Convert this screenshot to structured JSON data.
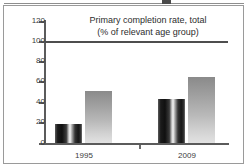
{
  "chart_data": {
    "type": "bar",
    "title": "Primary completion rate, total",
    "subtitle": "(% of relevant age group)",
    "xlabel": "",
    "ylabel": "",
    "ylim": [
      0,
      120
    ],
    "yticks": [
      0,
      20,
      40,
      60,
      80,
      100,
      120
    ],
    "ytick_labels": [
      "0",
      "20",
      "40",
      "60",
      "80",
      "100",
      "120"
    ],
    "grid": false,
    "legend": "none",
    "categories": [
      "1995",
      "2009"
    ],
    "series": [
      {
        "name": "series-1",
        "values": [
          19,
          43
        ],
        "style": "dark-gradient"
      },
      {
        "name": "series-2",
        "values": [
          51,
          64
        ],
        "style": "light-gradient"
      }
    ],
    "reference_line": {
      "value": 100,
      "label": ""
    },
    "colors": {
      "axis": "#5b5b5b",
      "reference_line": "#4e4e4e",
      "series_1_dark": "#141414",
      "series_1_highlight": "#f1f1f1",
      "series_2_top": "#8a8a8a",
      "series_2_bottom": "#e2e2e2",
      "frame_border": "#9a9a9a",
      "text": "#2d2d2d",
      "background": "#ffffff"
    }
  },
  "ticks": {
    "t120": "120",
    "t100": "100",
    "t80": "80",
    "t60": "60",
    "t40": "40",
    "t20": "20",
    "t0": "0"
  },
  "group_labels": {
    "g1": "1995",
    "g2": "2009"
  }
}
